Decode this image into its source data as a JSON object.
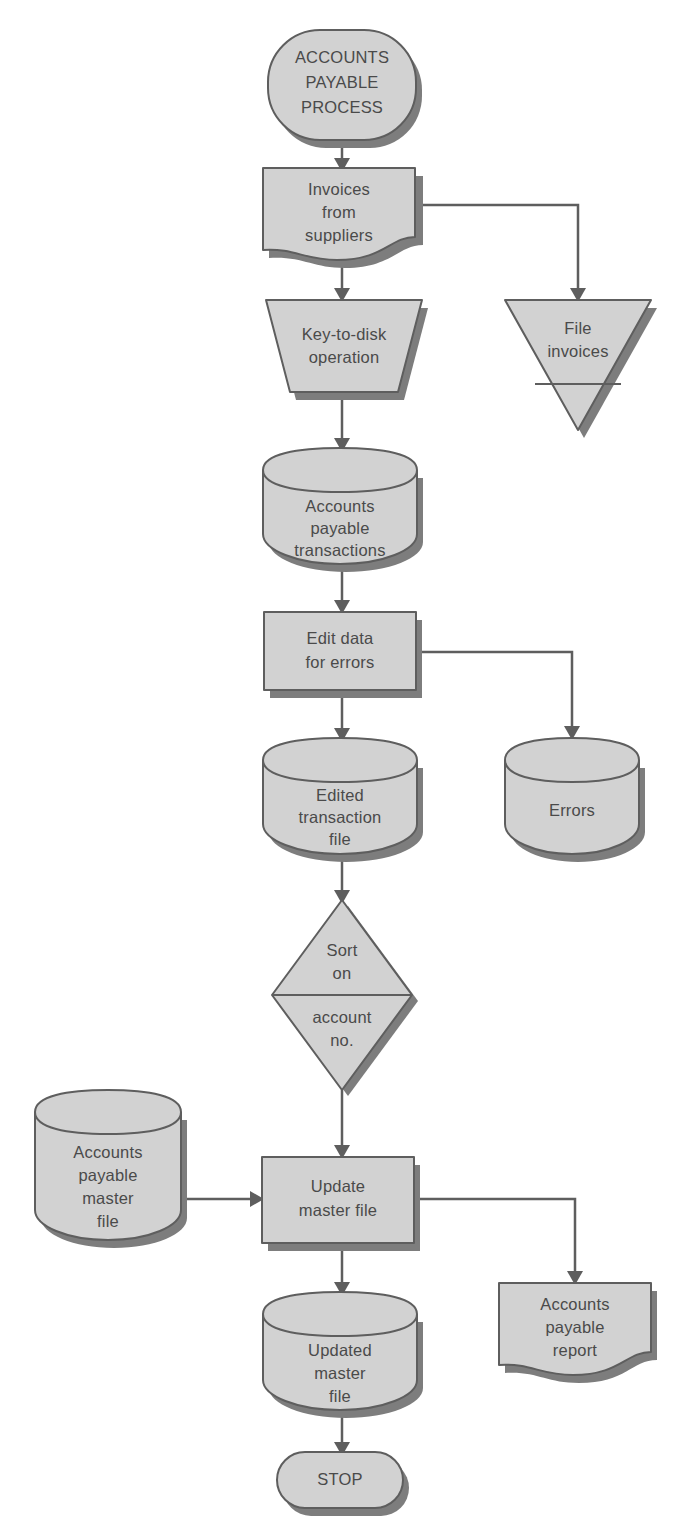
{
  "diagram": {
    "type": "flowchart",
    "background_color": "#ffffff",
    "shape_fill_color": "#d2d2d2",
    "shape_stroke_color": "#5e5e5e",
    "shadow_color": "#7d7d7d",
    "text_color": "#4a4a4a"
  },
  "nodes": {
    "start": {
      "id": "start",
      "shape": "terminator",
      "lines": [
        "ACCOUNTS",
        "PAYABLE",
        "PROCESS"
      ],
      "x": 268,
      "y": 30,
      "w": 148,
      "h": 110
    },
    "invoices_from_suppliers": {
      "id": "invoices_from_suppliers",
      "shape": "document",
      "lines": [
        "Invoices",
        "from",
        "suppliers"
      ],
      "x": 263,
      "y": 168,
      "w": 152,
      "h": 92
    },
    "file_invoices": {
      "id": "file_invoices",
      "shape": "offline-storage",
      "lines": [
        "File",
        "invoices"
      ],
      "x": 505,
      "y": 300,
      "w": 146,
      "h": 130
    },
    "key_to_disk": {
      "id": "key_to_disk",
      "shape": "manual-operation",
      "lines": [
        "Key-to-disk",
        "operation"
      ],
      "x": 266,
      "y": 300,
      "w": 156,
      "h": 92
    },
    "ap_transactions": {
      "id": "ap_transactions",
      "shape": "cylinder",
      "lines": [
        "Accounts",
        "payable",
        "transactions"
      ],
      "x": 263,
      "y": 448,
      "w": 154,
      "h": 116
    },
    "edit_data": {
      "id": "edit_data",
      "shape": "process",
      "lines": [
        "Edit data",
        "for errors"
      ],
      "x": 264,
      "y": 612,
      "w": 152,
      "h": 78
    },
    "edited_transaction_file": {
      "id": "edited_transaction_file",
      "shape": "cylinder",
      "lines": [
        "Edited",
        "transaction",
        "file"
      ],
      "x": 263,
      "y": 738,
      "w": 154,
      "h": 116
    },
    "errors": {
      "id": "errors",
      "shape": "cylinder",
      "lines": [
        "Errors"
      ],
      "x": 505,
      "y": 738,
      "w": 134,
      "h": 116
    },
    "sort_on_account_no": {
      "id": "sort_on_account_no",
      "shape": "sort",
      "lines_top": [
        "Sort",
        "on"
      ],
      "lines_bottom": [
        "account",
        "no."
      ],
      "x": 272,
      "y": 900,
      "w": 140,
      "h": 190
    },
    "ap_master_file": {
      "id": "ap_master_file",
      "shape": "cylinder",
      "lines": [
        "Accounts",
        "payable",
        "master",
        "file"
      ],
      "x": 35,
      "y": 1090,
      "w": 146,
      "h": 150
    },
    "update_master_file": {
      "id": "update_master_file",
      "shape": "process",
      "lines": [
        "Update",
        "master file"
      ],
      "x": 262,
      "y": 1157,
      "w": 152,
      "h": 86
    },
    "updated_master_file": {
      "id": "updated_master_file",
      "shape": "cylinder",
      "lines": [
        "Updated",
        "master",
        "file"
      ],
      "x": 263,
      "y": 1292,
      "w": 154,
      "h": 118
    },
    "ap_report": {
      "id": "ap_report",
      "shape": "document",
      "lines": [
        "Accounts",
        "payable",
        "report"
      ],
      "x": 499,
      "y": 1283,
      "w": 152,
      "h": 92
    },
    "stop": {
      "id": "stop",
      "shape": "terminator",
      "lines": [
        "STOP"
      ],
      "x": 277,
      "y": 1452,
      "w": 126,
      "h": 56
    }
  },
  "connections": [
    {
      "from": "start",
      "to": "invoices_from_suppliers",
      "kind": "vertical"
    },
    {
      "from": "invoices_from_suppliers",
      "to": "file_invoices",
      "kind": "elbow-right"
    },
    {
      "from": "invoices_from_suppliers",
      "to": "key_to_disk",
      "kind": "vertical"
    },
    {
      "from": "key_to_disk",
      "to": "ap_transactions",
      "kind": "vertical"
    },
    {
      "from": "ap_transactions",
      "to": "edit_data",
      "kind": "vertical"
    },
    {
      "from": "edit_data",
      "to": "errors",
      "kind": "elbow-right"
    },
    {
      "from": "edit_data",
      "to": "edited_transaction_file",
      "kind": "vertical"
    },
    {
      "from": "edited_transaction_file",
      "to": "sort_on_account_no",
      "kind": "vertical"
    },
    {
      "from": "sort_on_account_no",
      "to": "update_master_file",
      "kind": "vertical"
    },
    {
      "from": "ap_master_file",
      "to": "update_master_file",
      "kind": "horizontal"
    },
    {
      "from": "update_master_file",
      "to": "ap_report",
      "kind": "elbow-right"
    },
    {
      "from": "update_master_file",
      "to": "updated_master_file",
      "kind": "vertical"
    },
    {
      "from": "updated_master_file",
      "to": "stop",
      "kind": "vertical"
    }
  ]
}
